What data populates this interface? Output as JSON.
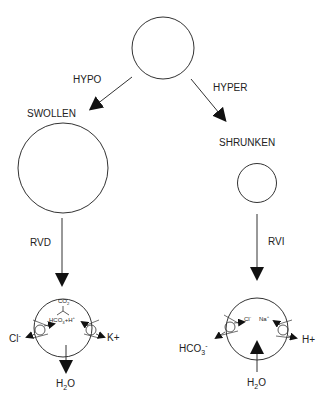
{
  "diagram": {
    "type": "cell-volume-regulation",
    "labels": {
      "hypo": "HYPO",
      "hyper": "HYPER",
      "swollen": "SWOLLEN",
      "shrunken": "SHRUNKEN",
      "rvd": "RVD",
      "rvi": "RVI"
    },
    "rvd_cell": {
      "co2": "CO2",
      "hco3_h": "HCO3+H+",
      "cl_out": "Cl-",
      "k_out": "K+",
      "water": "H2O",
      "water_direction": "out"
    },
    "rvi_cell": {
      "cl_in": "Cl-",
      "na_in": "Na+",
      "hco3_out": "HCO3-",
      "h_out": "H+",
      "water": "H2O",
      "water_direction": "in"
    },
    "colors": {
      "stroke": "#333333",
      "background": "#ffffff"
    }
  }
}
